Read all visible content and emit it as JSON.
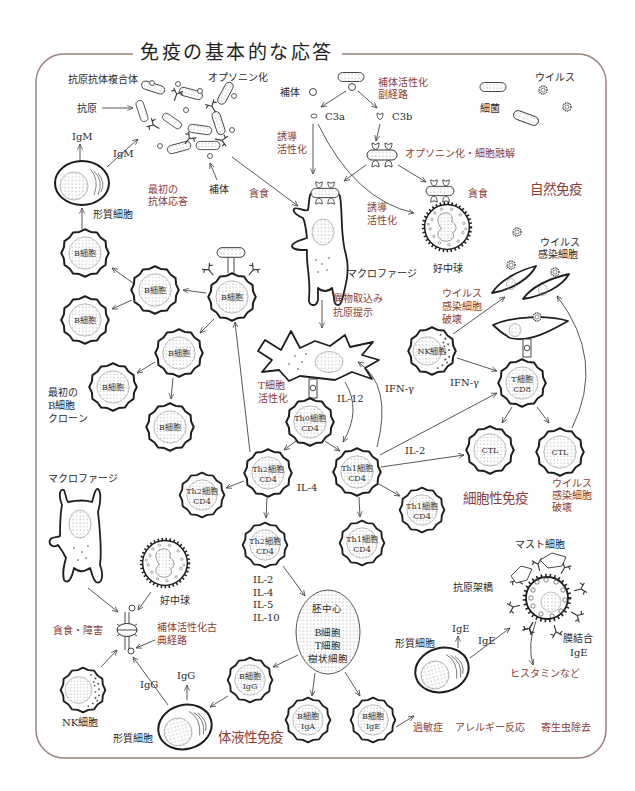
{
  "title": "免疫の基本的な応答",
  "colors": {
    "frame": "#9c827d",
    "accent": "#8b3d36",
    "ink": "#1e1e1e"
  },
  "innate": {
    "section_title": "自然免疫",
    "immune_complex": "抗原抗体複合体",
    "opsonization": "オプソニン化",
    "antigen": "抗原",
    "igm_up": "IgM",
    "igm_side": "IgM",
    "plasma_cell": "形質細胞",
    "first_antibody_response": [
      "最初の",
      "抗体応答"
    ],
    "complement_bottom": "補体",
    "phagocytosis_macrophage": "貪食",
    "complement_top": "補体",
    "alternative_pathway": [
      "補体活性化",
      "副経路"
    ],
    "c3a": "C3a",
    "c3b": "C3b",
    "induce_activate_1": [
      "誘導",
      "活性化"
    ],
    "induce_activate_2": [
      "誘導",
      "活性化"
    ],
    "opsonization_lysis": "オプソニン化・細胞融解",
    "phagocytosis_neutrophil": "貪食",
    "bacteria": "細菌",
    "virus": "ウイルス",
    "macrophage": "マクロファージ",
    "neutrophil": "好中球",
    "antigen_uptake": [
      "異物取込み",
      "抗原提示"
    ]
  },
  "b_cells": {
    "labels": [
      "B細胞",
      "B細胞",
      "B細胞",
      "B細胞",
      "B細胞",
      "B細胞",
      "B細胞"
    ],
    "first_clone": [
      "最初の",
      "B細胞",
      "クローン"
    ]
  },
  "cellular": {
    "section_title": "細胞性免疫",
    "virus_infected_cells": [
      "ウイルス",
      "感染細胞"
    ],
    "nk_destroy": [
      "ウイルス",
      "感染細胞",
      "破壊"
    ],
    "ctl_destroy": [
      "ウイルス",
      "感染細胞",
      "破壊"
    ],
    "t_activation": [
      "T細胞",
      "活性化"
    ],
    "il12": "IL-12",
    "ifng_left": "IFN-γ",
    "ifng_right": "IFN-γ",
    "il2": "IL-2",
    "il4": "IL-4",
    "nk_cell": "NK細胞",
    "cd8": [
      "T細胞",
      "CD8"
    ],
    "ctl_1": "CTL",
    "ctl_2": "CTL",
    "th0": [
      "Th0細胞",
      "CD4"
    ],
    "th2_main": [
      "Th2細胞",
      "CD4"
    ],
    "th1_main": [
      "Th1細胞",
      "CD4"
    ],
    "th2_left": [
      "Th2細胞",
      "CD4"
    ],
    "th1_right": [
      "Th1細胞",
      "CD4"
    ],
    "th2_bottom": [
      "Th2細胞",
      "CD4"
    ],
    "th1_bottom": [
      "Th1細胞",
      "CD4"
    ]
  },
  "humoral": {
    "section_title": "体液性免疫",
    "cytokines": [
      "IL-2",
      "IL-4",
      "IL-5",
      "IL-10"
    ],
    "germinal_center": "胚中心",
    "germinal_contents": [
      "B細胞",
      "T細胞",
      "樹状細胞"
    ],
    "b_igg": [
      "B細胞",
      "IgG"
    ],
    "b_iga": [
      "B細胞",
      "IgA"
    ],
    "b_ige": [
      "B細胞",
      "IgE"
    ],
    "igg_diag": "IgG",
    "igg_up": "IgG",
    "plasma_cell_left": "形質細胞",
    "plasma_cell_right": "形質細胞",
    "ige_up": "IgE",
    "ige_side": "IgE",
    "macrophage": "マクロファージ",
    "neutrophil": "好中球",
    "nk_cell": "NK細胞",
    "phago_damage": "貪食・障害",
    "classical_pathway": [
      "補体活性化古",
      "典経路"
    ]
  },
  "allergy": {
    "mast_cell": "マスト細胞",
    "antigen_crosslink": "抗原架橋",
    "membrane_ige": [
      "膜結合",
      "IgE"
    ],
    "histamine": "ヒスタミンなど",
    "outcomes": [
      "過敏症",
      "アレルギー反応",
      "寄生虫除去"
    ]
  }
}
